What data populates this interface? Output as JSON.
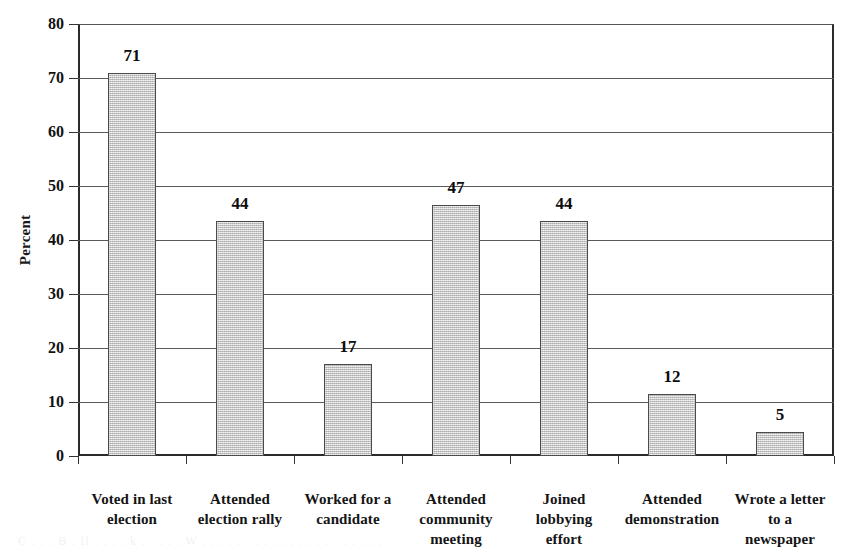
{
  "chart_data": {
    "type": "bar",
    "title": "",
    "xlabel": "",
    "ylabel": "Percent",
    "ylim": [
      0,
      80
    ],
    "ytick_step": 10,
    "yticks": [
      0,
      10,
      20,
      30,
      40,
      50,
      60,
      70,
      80
    ],
    "grid": true,
    "legend": "none",
    "categories": [
      "Voted in last election",
      "Attended election rally",
      "Worked for a candidate",
      "Attended community meeting",
      "Joined lobbying effort",
      "Attended demonstration",
      "Wrote a letter to a newspaper"
    ],
    "category_lines": [
      [
        "Voted in last",
        "election"
      ],
      [
        "Attended",
        "election rally"
      ],
      [
        "Worked for a",
        "candidate"
      ],
      [
        "Attended",
        "community",
        "meeting"
      ],
      [
        "Joined",
        "lobbying",
        "effort"
      ],
      [
        "Attended",
        "demonstration"
      ],
      [
        "Wrote a letter",
        "to a",
        "newspaper"
      ]
    ],
    "values": [
      71,
      44,
      17,
      47,
      44,
      12,
      5
    ],
    "value_labels": [
      "71",
      "44",
      "17",
      "47",
      "44",
      "12",
      "5"
    ],
    "bar_pixel_heights": [
      71,
      43.5,
      17,
      46.5,
      43.5,
      11.5,
      4.5
    ],
    "colors": {
      "bar_fill": "#c9c9c9",
      "bar_edge": "#4a4a4a",
      "gridline": "#5a5a5a",
      "axis": "#2b2b2b",
      "text": "#111111"
    }
  },
  "artifacts": {
    "scan_bleed_text": "C . . . B . ll . . . . k . . . . . W . . . . . . . . . . . . . . . . . . . . ."
  }
}
